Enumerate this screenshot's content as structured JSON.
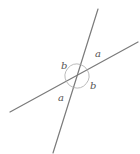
{
  "diagram": {
    "type": "intersecting-lines",
    "colors": {
      "line": "#7a7a7a",
      "arc": "#a8a8a8",
      "label": "#555555"
    },
    "lines": [
      {
        "name": "steep-line",
        "x1": 98,
        "y1": 9,
        "x2": 53,
        "y2": 153
      },
      {
        "name": "shallow-line",
        "x1": 138,
        "y1": 42,
        "x2": 10,
        "y2": 112
      }
    ],
    "intersection": {
      "x": 77,
      "y": 76
    },
    "labels": [
      {
        "id": "label-a-top",
        "text": "a",
        "x": 95,
        "y": 57
      },
      {
        "id": "label-b-left",
        "text": "b",
        "x": 62,
        "y": 69
      },
      {
        "id": "label-b-right",
        "text": "b",
        "x": 90,
        "y": 88
      },
      {
        "id": "label-a-bottom",
        "text": "a",
        "x": 58,
        "y": 101
      }
    ]
  }
}
